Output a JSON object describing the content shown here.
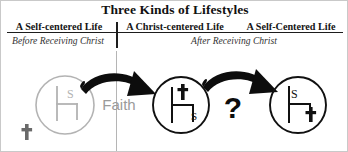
{
  "title": "Three Kinds of Lifestyles",
  "columns": [
    {
      "header": "A Self-centered Life"
    },
    {
      "header": "A Christ-centered Life"
    },
    {
      "header": "A Self-Centered Life"
    }
  ],
  "phases": [
    {
      "label": "Before Receiving Christ"
    },
    {
      "label": "After Receiving Christ"
    }
  ],
  "labels": {
    "faith": "Faith",
    "question": "?"
  },
  "circles": [
    {
      "name": "self-centered-before",
      "throne_occupant": "S",
      "cross_position": "outside-bottom-left",
      "cross_glyph": "✝",
      "style": "light-gray"
    },
    {
      "name": "christ-centered",
      "throne_occupant": "✝",
      "self_marker": "S",
      "self_position": "inside-lower-right",
      "style": "black"
    },
    {
      "name": "self-centered-after",
      "throne_occupant": "S",
      "cross_position": "inside-lower-right",
      "cross_glyph": "✝",
      "style": "black"
    }
  ],
  "arrows": [
    {
      "name": "faith-arrow",
      "from": "self-centered-before",
      "to": "christ-centered"
    },
    {
      "name": "question-arrow",
      "from": "christ-centered",
      "to": "self-centered-after"
    }
  ],
  "colors": {
    "ink": "#111111",
    "muted": "#9a9a9a",
    "light_circle": "#b3b3b3",
    "rule": "#1d1d1d",
    "divider_light": "#b5b5b5",
    "background": "#ffffff"
  }
}
